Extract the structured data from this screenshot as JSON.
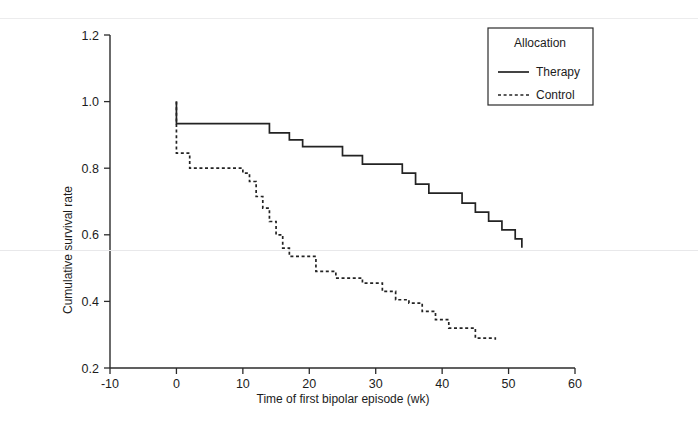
{
  "chart_data": {
    "type": "line",
    "subtype": "kaplan-meier-step",
    "title": "",
    "xlabel": "Time of first bipolar episode (wk)",
    "ylabel": "Cumulative survival rate",
    "xlim": [
      -10,
      60
    ],
    "ylim": [
      0.2,
      1.2
    ],
    "xticks": [
      -10,
      0,
      10,
      20,
      30,
      40,
      50,
      60
    ],
    "xticklabels": [
      "-10",
      "0",
      "10",
      "20",
      "30",
      "40",
      "50",
      "60"
    ],
    "yticks": [
      0.2,
      0.4,
      0.6,
      0.8,
      1.0,
      1.2
    ],
    "yticklabels": [
      "0.2",
      "0.4",
      "0.6",
      "0.8",
      "1.0",
      "1.2"
    ],
    "grid": false,
    "legend": {
      "title": "Allocation",
      "position": "top-right",
      "entries": [
        {
          "label": "Therapy",
          "style": "solid"
        },
        {
          "label": "Control",
          "style": "dashed"
        }
      ]
    },
    "series": [
      {
        "name": "Therapy",
        "style": "solid",
        "x": [
          0,
          0,
          1,
          12,
          14,
          17,
          19,
          22,
          25,
          28,
          31,
          34,
          36,
          38,
          41,
          43,
          45,
          47,
          49,
          51,
          52
        ],
        "y": [
          1.0,
          0.934,
          0.934,
          0.934,
          0.906,
          0.885,
          0.865,
          0.865,
          0.838,
          0.812,
          0.812,
          0.785,
          0.752,
          0.725,
          0.725,
          0.695,
          0.668,
          0.641,
          0.615,
          0.588,
          0.561
        ]
      },
      {
        "name": "Control",
        "style": "dashed",
        "x": [
          0,
          0,
          1,
          2,
          4,
          9,
          10,
          11,
          12,
          13,
          14,
          15,
          16,
          17,
          20,
          21,
          24,
          28,
          31,
          33,
          35,
          37,
          39,
          41,
          43,
          45,
          48
        ],
        "y": [
          1.0,
          0.845,
          0.845,
          0.8,
          0.8,
          0.8,
          0.785,
          0.76,
          0.715,
          0.68,
          0.64,
          0.6,
          0.56,
          0.535,
          0.535,
          0.49,
          0.47,
          0.455,
          0.43,
          0.405,
          0.395,
          0.37,
          0.345,
          0.32,
          0.32,
          0.29,
          0.285
        ]
      }
    ]
  },
  "axes": {
    "x_axis_name": "x-axis",
    "y_axis_name": "y-axis"
  }
}
